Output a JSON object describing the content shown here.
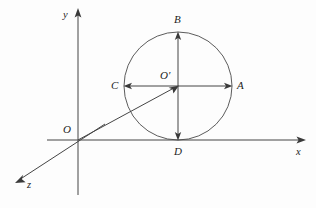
{
  "figure": {
    "background_color": "#fdfdfd",
    "line_color": "#454545",
    "label_color": "#1d1d1d"
  },
  "axes": [
    {
      "name": "y-axis",
      "label": "y",
      "label_x": 63,
      "label_y": 10,
      "direction": "up"
    },
    {
      "name": "x-axis",
      "label": "x",
      "label_x": 296,
      "label_y": 147,
      "direction": "right"
    },
    {
      "name": "z-axis",
      "label": "z",
      "label_x": 27,
      "label_y": 180,
      "direction": "down-left"
    }
  ],
  "points": [
    {
      "name": "O",
      "label": "O",
      "label_x": 63,
      "label_y": 124,
      "x": 78,
      "y": 140,
      "role": "origin"
    },
    {
      "name": "O'",
      "label": "O′",
      "label_x": 160,
      "label_y": 70,
      "x": 178,
      "y": 86,
      "role": "circle-center"
    },
    {
      "name": "A",
      "label": "A",
      "label_x": 237,
      "label_y": 80,
      "x": 232,
      "y": 86,
      "role": "circle-right"
    },
    {
      "name": "B",
      "label": "B",
      "label_x": 174,
      "label_y": 14,
      "x": 178,
      "y": 32,
      "role": "circle-top"
    },
    {
      "name": "C",
      "label": "C",
      "label_x": 111,
      "label_y": 80,
      "x": 124,
      "y": 86,
      "role": "circle-left"
    },
    {
      "name": "D",
      "label": "D",
      "label_x": 174,
      "label_y": 146,
      "x": 178,
      "y": 140,
      "role": "circle-bottom-tangent"
    }
  ],
  "circle": {
    "name": "main-circle",
    "center_x": 178,
    "center_y": 86,
    "radius": 54
  },
  "segments": [
    {
      "name": "origin-to-center-ray",
      "x1": 78,
      "y1": 140,
      "x2": 178,
      "y2": 86,
      "arrow": "end"
    },
    {
      "name": "horizontal-diameter",
      "x1": 124,
      "y1": 86,
      "x2": 232,
      "y2": 86,
      "arrow": "both"
    },
    {
      "name": "vertical-diameter",
      "x1": 178,
      "y1": 32,
      "x2": 178,
      "y2": 140,
      "arrow": "both"
    }
  ]
}
